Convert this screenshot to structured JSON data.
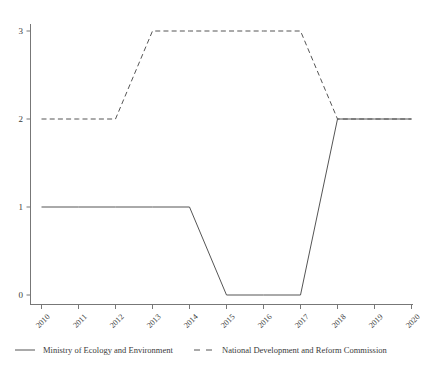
{
  "chart_data": {
    "type": "line",
    "title": "",
    "subtitle": "",
    "xlabel": "",
    "ylabel": "",
    "x": [
      "2010",
      "2011",
      "2012",
      "2013",
      "2014",
      "2015",
      "2016",
      "2017",
      "2018",
      "2019",
      "2020"
    ],
    "xtick_labels": [
      "2010",
      "2011",
      "2012",
      "2013",
      "2014",
      "2015",
      "2016",
      "2017",
      "2018",
      "2019",
      "2020"
    ],
    "ytick_labels": [
      "0",
      "1",
      "2",
      "3"
    ],
    "yticks": [
      0,
      1,
      2,
      3
    ],
    "ylim": [
      -0.12,
      3.3
    ],
    "xlim": [
      2009.65,
      2020.35
    ],
    "grid": false,
    "legend_position": "bottom",
    "series": [
      {
        "name": "Ministry of Ecology and Environment",
        "style": "solid",
        "color": "#555555",
        "values": [
          1,
          1,
          1,
          1,
          1,
          0,
          0,
          0,
          2,
          2,
          2
        ]
      },
      {
        "name": "National Development and Reform Commission",
        "style": "dashed",
        "color": "#555555",
        "values": [
          2,
          2,
          2,
          3,
          3,
          3,
          3,
          3,
          2,
          2,
          2
        ]
      }
    ]
  },
  "legend": {
    "items": [
      {
        "label": "Ministry of Ecology and Environment",
        "style": "solid"
      },
      {
        "label": "National Development and Reform Commission",
        "style": "dashed"
      }
    ]
  },
  "colors": {
    "line": "#555555",
    "axis": "#777777",
    "text": "#3a3a3a",
    "background": "#ffffff"
  }
}
